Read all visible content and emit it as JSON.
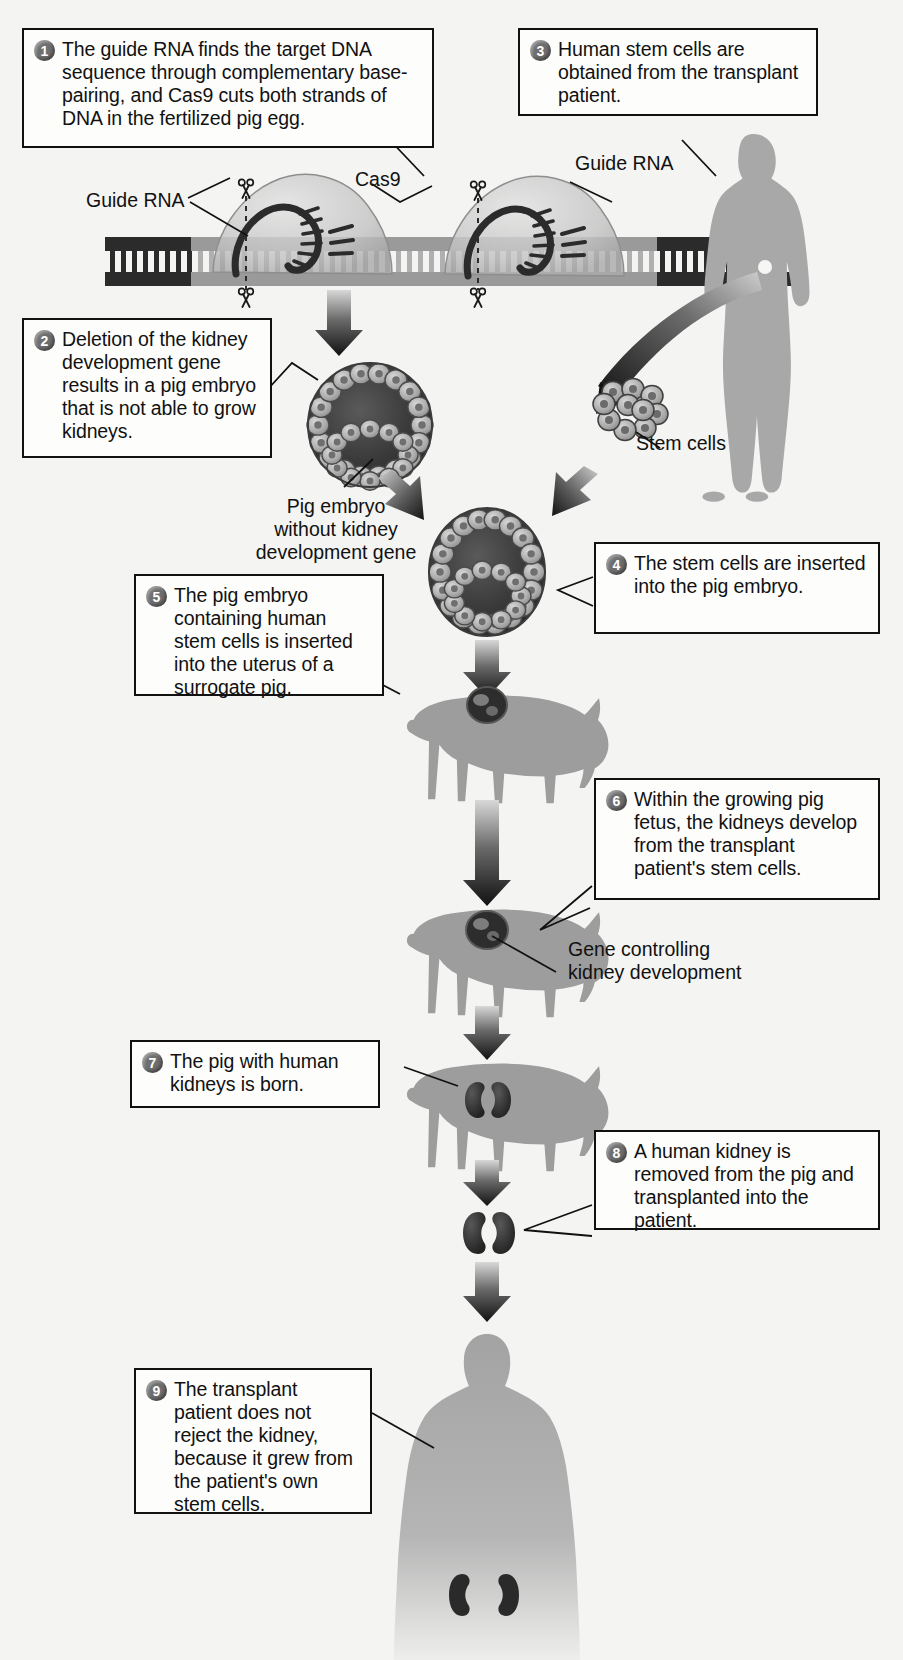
{
  "colors": {
    "ink": "#111111",
    "box_fill": "#fdfdfc",
    "page_bg": "#f4f4f2",
    "badge": "#6e6e6e",
    "silhouette": "#a8a8a8",
    "pig": "#9d9d9d",
    "arrow_dark": "#1b1b1b",
    "embryo_dark": "#3a3a3a",
    "cell_light": "#b9b9b9",
    "kidney": "#2e2e2e",
    "cas9_blob": "#c9c9c9",
    "dna_dark": "#2b2b2b",
    "dna_mid": "#9a9a9a"
  },
  "steps": [
    {
      "num": "1",
      "text": "The guide RNA finds the target DNA sequence through complementary base-pairing, and Cas9 cuts both strands of DNA in the fertilized pig egg."
    },
    {
      "num": "2",
      "text": "Deletion of the kidney development gene results in a pig embryo that is not able to grow kidneys."
    },
    {
      "num": "3",
      "text": "Human stem cells are obtained from the transplant patient."
    },
    {
      "num": "4",
      "text": "The stem cells are inserted into the pig embryo."
    },
    {
      "num": "5",
      "text": "The pig embryo containing human stem cells is inserted into the uterus of a surrogate pig."
    },
    {
      "num": "6",
      "text": "Within the growing pig fetus, the kidneys develop from the transplant patient's stem cells."
    },
    {
      "num": "7",
      "text": "The pig with human kidneys is born."
    },
    {
      "num": "8",
      "text": "A human kidney is removed from the pig and transplanted into the patient."
    },
    {
      "num": "9",
      "text": "The transplant patient does not reject the kidney, because it grew from the patient's own stem cells."
    }
  ],
  "labels": {
    "guide_rna_left": "Guide RNA",
    "guide_rna_right": "Guide RNA",
    "cas9": "Cas9",
    "stem_cells": "Stem cells",
    "pig_embryo_caption": "Pig embryo\nwithout kidney\ndevelopment gene",
    "pig_embryo_line1": "Pig embryo",
    "pig_embryo_line2": "without kidney",
    "pig_embryo_line3": "development gene",
    "gene_controlling_line1": "Gene controlling",
    "gene_controlling_line2": "kidney development"
  },
  "icons": {
    "scissors": "scissors-icon",
    "arrow_down": "down-arrow-icon",
    "badge": "step-number-badge"
  }
}
